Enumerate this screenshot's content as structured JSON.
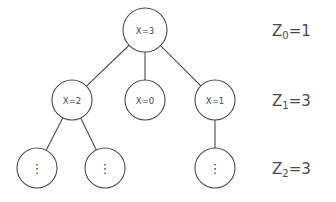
{
  "figure": {
    "title": "",
    "background_color": "#ffffff",
    "stroke_color": "#4a4a4a",
    "text_color": "#4a4a4a"
  },
  "chart_data": {
    "type": "diagram",
    "diagram_type": "tree",
    "title": "",
    "nodes": [
      {
        "id": "root",
        "label": "X=3",
        "level": 0,
        "cx": 145,
        "cy": 30,
        "r": 22,
        "is_ellipsis": false
      },
      {
        "id": "n1",
        "label": "X=2",
        "level": 1,
        "cx": 72,
        "cy": 100,
        "r": 20,
        "is_ellipsis": false
      },
      {
        "id": "n2",
        "label": "X=0",
        "level": 1,
        "cx": 145,
        "cy": 100,
        "r": 20,
        "is_ellipsis": false
      },
      {
        "id": "n3",
        "label": "X=1",
        "level": 1,
        "cx": 215,
        "cy": 100,
        "r": 20,
        "is_ellipsis": false
      },
      {
        "id": "l1",
        "label": "⋮",
        "level": 2,
        "cx": 37,
        "cy": 168,
        "r": 20,
        "is_ellipsis": true
      },
      {
        "id": "l2",
        "label": "⋮",
        "level": 2,
        "cx": 105,
        "cy": 168,
        "r": 20,
        "is_ellipsis": true
      },
      {
        "id": "l3",
        "label": "⋮",
        "level": 2,
        "cx": 215,
        "cy": 168,
        "r": 20,
        "is_ellipsis": true
      }
    ],
    "edges": [
      {
        "from": "root",
        "to": "n1"
      },
      {
        "from": "root",
        "to": "n2"
      },
      {
        "from": "root",
        "to": "n3"
      },
      {
        "from": "n1",
        "to": "l1"
      },
      {
        "from": "n1",
        "to": "l2"
      },
      {
        "from": "n3",
        "to": "l3"
      }
    ],
    "annotations": [
      {
        "name": "level-0-count",
        "symbol": "Z",
        "subscript": "0",
        "equals": "=",
        "value": "1",
        "text": "Z0=1",
        "level": 0,
        "y": 22
      },
      {
        "name": "level-1-count",
        "symbol": "Z",
        "subscript": "1",
        "equals": "=",
        "value": "3",
        "text": "Z1=3",
        "level": 1,
        "y": 92
      },
      {
        "name": "level-2-count",
        "symbol": "Z",
        "subscript": "2",
        "equals": "=",
        "value": "3",
        "text": "Z2=3",
        "level": 2,
        "y": 160
      }
    ],
    "annotation_x": 272
  }
}
